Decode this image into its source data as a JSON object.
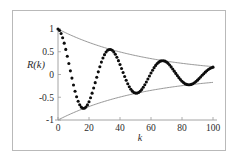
{
  "figure": {
    "background_color": "#ffffff",
    "frame_color": "#b9b9b9",
    "axis_color": "#9a9a9a",
    "data_color": "#0d0d0d",
    "envelope_color": "#8c8c8c"
  },
  "chart_data": {
    "type": "scatter",
    "title": "",
    "subtitle": "",
    "xlabel": "k",
    "ylabel": "R(k)",
    "xlim": [
      0,
      100
    ],
    "ylim": [
      -1,
      1
    ],
    "xticks": [
      0,
      20,
      40,
      60,
      80,
      100
    ],
    "xtick_labels": [
      "0",
      "20",
      "40",
      "60",
      "80",
      "100"
    ],
    "yticks": [
      -1,
      -0.5,
      0,
      0.5,
      1
    ],
    "ytick_labels": [
      "-1",
      "-0.5",
      "0",
      "0.5",
      "1"
    ],
    "grid": false,
    "legend": null,
    "legend_position": "none",
    "annotations": [],
    "model": {
      "form": "R(k) = exp(-k/tau) * cos(2*pi*k/period)",
      "tau": 57,
      "period": 34,
      "envelope_upper_form": "exp(-k/tau)",
      "envelope_lower_form": "-exp(-k/tau)",
      "envelope_at_k0": 1.0,
      "envelope_at_k100": 0.17
    },
    "series": [
      {
        "name": "R(k)",
        "style": "dots",
        "x": [
          0,
          2,
          4,
          6,
          8,
          10,
          12,
          14,
          16,
          18,
          20,
          22,
          24,
          26,
          28,
          30,
          32,
          34,
          36,
          38,
          40,
          42,
          44,
          46,
          48,
          50,
          52,
          54,
          56,
          58,
          60,
          62,
          64,
          66,
          68,
          70,
          72,
          74,
          76,
          78,
          80,
          82,
          84,
          86,
          88,
          90,
          92,
          94,
          96,
          98,
          100
        ],
        "values": [
          1.0,
          0.9,
          0.74,
          0.53,
          0.28,
          0.02,
          -0.24,
          -0.47,
          -0.64,
          -0.74,
          -0.77,
          -0.73,
          -0.62,
          -0.46,
          -0.26,
          -0.05,
          0.16,
          0.33,
          0.45,
          0.51,
          0.51,
          0.46,
          0.37,
          0.23,
          0.08,
          -0.08,
          -0.22,
          -0.32,
          -0.39,
          -0.41,
          -0.38,
          -0.32,
          -0.22,
          -0.11,
          0.02,
          0.14,
          0.23,
          0.29,
          0.31,
          0.29,
          0.24,
          0.17,
          0.08,
          -0.01,
          -0.09,
          -0.16,
          -0.21,
          -0.23,
          -0.22,
          -0.19,
          -0.14
        ]
      },
      {
        "name": "upper envelope",
        "style": "line",
        "x": [
          0,
          10,
          20,
          30,
          40,
          50,
          60,
          70,
          80,
          90,
          100
        ],
        "values": [
          1.0,
          0.84,
          0.7,
          0.59,
          0.5,
          0.42,
          0.35,
          0.29,
          0.25,
          0.21,
          0.17
        ]
      },
      {
        "name": "lower envelope",
        "style": "line",
        "x": [
          0,
          10,
          20,
          30,
          40,
          50,
          60,
          70,
          80,
          90,
          100
        ],
        "values": [
          -1.0,
          -0.84,
          -0.7,
          -0.59,
          -0.5,
          -0.42,
          -0.35,
          -0.29,
          -0.25,
          -0.21,
          -0.17
        ]
      }
    ],
    "key_features": {
      "first_trough_k": 17,
      "first_trough_value": -0.78,
      "first_peak_k": 33,
      "first_peak_value": 0.51,
      "second_trough_k": 51,
      "second_trough_value": -0.35,
      "second_peak_k": 69,
      "second_peak_value": 0.28,
      "third_trough_k": 86,
      "third_trough_value": -0.22
    }
  }
}
